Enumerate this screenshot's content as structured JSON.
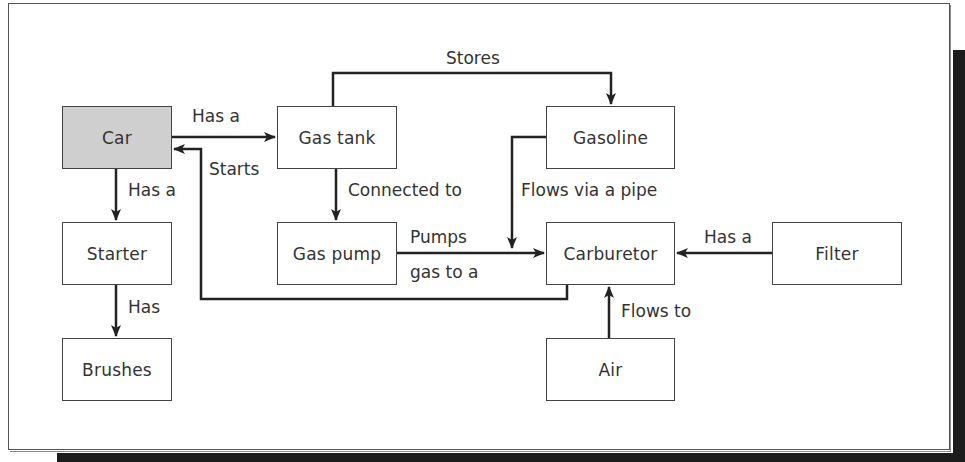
{
  "diagram": {
    "nodes": {
      "car": {
        "label": "Car",
        "x": 62,
        "y": 106,
        "w": 110,
        "h": 63,
        "fill": "#cfcfcf"
      },
      "gas_tank": {
        "label": "Gas tank",
        "x": 277,
        "y": 106,
        "w": 120,
        "h": 63
      },
      "gasoline": {
        "label": "Gasoline",
        "x": 546,
        "y": 106,
        "w": 129,
        "h": 63
      },
      "starter": {
        "label": "Starter",
        "x": 62,
        "y": 222,
        "w": 110,
        "h": 63
      },
      "gas_pump": {
        "label": "Gas pump",
        "x": 277,
        "y": 222,
        "w": 120,
        "h": 63
      },
      "carburetor": {
        "label": "Carburetor",
        "x": 546,
        "y": 222,
        "w": 129,
        "h": 63
      },
      "filter": {
        "label": "Filter",
        "x": 772,
        "y": 222,
        "w": 130,
        "h": 63
      },
      "brushes": {
        "label": "Brushes",
        "x": 62,
        "y": 338,
        "w": 110,
        "h": 63
      },
      "air": {
        "label": "Air",
        "x": 546,
        "y": 338,
        "w": 129,
        "h": 63
      }
    },
    "edges": [
      {
        "from": "Car",
        "to": "Gas tank",
        "label": "Has a"
      },
      {
        "from": "Gas tank",
        "to": "Gasoline",
        "label": "Stores"
      },
      {
        "from": "Car",
        "to": "Starter",
        "label": "Has a"
      },
      {
        "from": "Gas tank",
        "to": "Gas pump",
        "label": "Connected to"
      },
      {
        "from": "Gasoline",
        "to": "Carburetor",
        "label": "Flows via a pipe"
      },
      {
        "from": "Gas pump",
        "to": "Carburetor",
        "label": "Pumps gas to a"
      },
      {
        "from": "Carburetor",
        "to": "Car",
        "label": "Starts"
      },
      {
        "from": "Filter",
        "to": "Carburetor",
        "label": "Has a"
      },
      {
        "from": "Starter",
        "to": "Brushes",
        "label": "Has"
      },
      {
        "from": "Air",
        "to": "Carburetor",
        "label": "Flows to"
      }
    ],
    "edge_labels": {
      "car_gastank": "Has a",
      "stores": "Stores",
      "car_starter": "Has a",
      "starts": "Starts",
      "connected_to": "Connected to",
      "flows_via_pipe": "Flows via a pipe",
      "pumps_line1": "Pumps",
      "pumps_line2": "gas to a",
      "filter_has_a": "Has a",
      "starter_has": "Has",
      "flows_to": "Flows to"
    },
    "colors": {
      "line": "#222222",
      "box_border": "#444444",
      "highlight_fill": "#cfcfcf",
      "shadow": "#1c1c1c"
    }
  }
}
